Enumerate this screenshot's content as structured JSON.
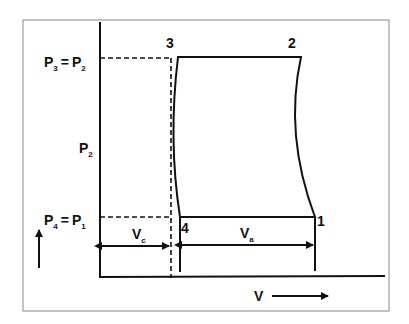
{
  "diagram": {
    "points": {
      "p1": "1",
      "p2": "2",
      "p3": "3",
      "p4": "4"
    },
    "y_labels": {
      "top": {
        "main": "P",
        "sub1": "3",
        "eq": "=",
        "main2": "P",
        "sub2": "2"
      },
      "mid": {
        "main": "P",
        "sub": "2"
      },
      "bottom": {
        "main": "P",
        "sub1": "4",
        "eq": "=",
        "main2": "P",
        "sub2": "1"
      }
    },
    "volumes": {
      "clearance": {
        "main": "V",
        "sub": "c"
      },
      "swept": {
        "main": "V",
        "sub": "a"
      }
    },
    "x_axis_label": "V",
    "colors": {
      "line": "#111111",
      "frame": "#888888",
      "background": "#ffffff"
    }
  }
}
